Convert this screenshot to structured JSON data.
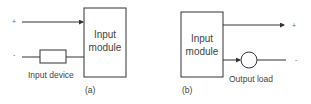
{
  "diagram_a": {
    "module_label_line1": "Input",
    "module_label_line2": "module",
    "plus_sign": "+",
    "minus_sign": "-",
    "device_label": "Input device",
    "caption": "(a)"
  },
  "diagram_b": {
    "module_label_line1": "Input",
    "module_label_line2": "module",
    "plus_sign": "+",
    "minus_sign": "-",
    "load_label": "Output load",
    "caption": "(b)"
  },
  "colors": {
    "line": "#333333",
    "text": "#444444"
  }
}
